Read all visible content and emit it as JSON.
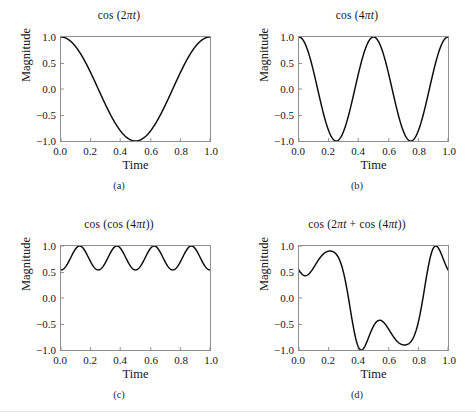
{
  "figure": {
    "background": "#ffffff",
    "curve_color": "#000000",
    "frame_color": "#8e8e8e"
  },
  "axes": {
    "xlabel": "Time",
    "ylabel": "Magnitude",
    "xticks": [
      "0.0",
      "0.2",
      "0.4",
      "0.6",
      "0.8",
      "1.0"
    ],
    "yticks": [
      "1.0",
      "0.5",
      "0.0",
      "−0.5",
      "−1.0"
    ],
    "xlim": [
      0,
      1
    ],
    "ylim": [
      -1,
      1
    ]
  },
  "panels": [
    {
      "key": "a",
      "caption": "(a)",
      "title_pre": "cos (2",
      "title_pi": "π",
      "title_var": "t",
      "title_post": ")",
      "title_plain": "cos (2πt)"
    },
    {
      "key": "b",
      "caption": "(b)",
      "title_pre": "cos (4",
      "title_pi": "π",
      "title_var": "t",
      "title_post": ")",
      "title_plain": "cos (4πt)"
    },
    {
      "key": "c",
      "caption": "(c)",
      "title_pre": "cos (cos (4",
      "title_pi": "π",
      "title_var": "t",
      "title_post": "))",
      "title_plain": "cos (cos (4πt))"
    },
    {
      "key": "d",
      "caption": "(d)",
      "title_pre": "cos (2",
      "title_pi": "π",
      "title_var": "t",
      "title_mid": " + cos (4",
      "title_pi2": "π",
      "title_var2": "t",
      "title_post": "))",
      "title_plain": "cos (2πt + cos (4πt))"
    }
  ],
  "chart_data": [
    {
      "type": "line",
      "panel": "a",
      "title": "cos (2πt)",
      "xlabel": "Time",
      "ylabel": "Magnitude",
      "xlim": [
        0,
        1
      ],
      "ylim": [
        -1,
        1
      ],
      "xticks": [
        0.0,
        0.2,
        0.4,
        0.6,
        0.8,
        1.0
      ],
      "yticks": [
        -1.0,
        -0.5,
        0.0,
        0.5,
        1.0
      ],
      "grid": false,
      "legend": null,
      "formula": "cos(2*pi*t)",
      "x": [
        0.0,
        0.025,
        0.05,
        0.075,
        0.1,
        0.125,
        0.15,
        0.175,
        0.2,
        0.225,
        0.25,
        0.275,
        0.3,
        0.325,
        0.35,
        0.375,
        0.4,
        0.425,
        0.45,
        0.475,
        0.5,
        0.525,
        0.55,
        0.575,
        0.6,
        0.625,
        0.65,
        0.675,
        0.7,
        0.725,
        0.75,
        0.775,
        0.8,
        0.825,
        0.85,
        0.875,
        0.9,
        0.925,
        0.95,
        0.975,
        1.0
      ],
      "y": [
        1.0,
        0.988,
        0.951,
        0.891,
        0.809,
        0.707,
        0.588,
        0.454,
        0.309,
        0.156,
        0.0,
        -0.156,
        -0.309,
        -0.454,
        -0.588,
        -0.707,
        -0.809,
        -0.891,
        -0.951,
        -0.988,
        -1.0,
        -0.988,
        -0.951,
        -0.891,
        -0.809,
        -0.707,
        -0.588,
        -0.454,
        -0.309,
        -0.156,
        0.0,
        0.156,
        0.309,
        0.454,
        0.588,
        0.707,
        0.809,
        0.891,
        0.951,
        0.988,
        1.0
      ]
    },
    {
      "type": "line",
      "panel": "b",
      "title": "cos (4πt)",
      "xlabel": "Time",
      "ylabel": "Magnitude",
      "xlim": [
        0,
        1
      ],
      "ylim": [
        -1,
        1
      ],
      "xticks": [
        0.0,
        0.2,
        0.4,
        0.6,
        0.8,
        1.0
      ],
      "yticks": [
        -1.0,
        -0.5,
        0.0,
        0.5,
        1.0
      ],
      "grid": false,
      "legend": null,
      "formula": "cos(4*pi*t)",
      "x": [
        0.0,
        0.025,
        0.05,
        0.075,
        0.1,
        0.125,
        0.15,
        0.175,
        0.2,
        0.225,
        0.25,
        0.275,
        0.3,
        0.325,
        0.35,
        0.375,
        0.4,
        0.425,
        0.45,
        0.475,
        0.5,
        0.525,
        0.55,
        0.575,
        0.6,
        0.625,
        0.65,
        0.675,
        0.7,
        0.725,
        0.75,
        0.775,
        0.8,
        0.825,
        0.85,
        0.875,
        0.9,
        0.925,
        0.95,
        0.975,
        1.0
      ],
      "y": [
        1.0,
        0.951,
        0.809,
        0.588,
        0.309,
        0.0,
        -0.309,
        -0.588,
        -0.809,
        -0.951,
        -1.0,
        -0.951,
        -0.809,
        -0.588,
        -0.309,
        0.0,
        0.309,
        0.588,
        0.809,
        0.951,
        1.0,
        0.951,
        0.809,
        0.588,
        0.309,
        0.0,
        -0.309,
        -0.588,
        -0.809,
        -0.951,
        -1.0,
        -0.951,
        -0.809,
        -0.588,
        -0.309,
        0.0,
        0.309,
        0.588,
        0.809,
        0.951,
        1.0
      ]
    },
    {
      "type": "line",
      "panel": "c",
      "title": "cos (cos (4πt))",
      "xlabel": "Time",
      "ylabel": "Magnitude",
      "xlim": [
        0,
        1
      ],
      "ylim": [
        -1,
        1
      ],
      "xticks": [
        0.0,
        0.2,
        0.4,
        0.6,
        0.8,
        1.0
      ],
      "yticks": [
        -1.0,
        -0.5,
        0.0,
        0.5,
        1.0
      ],
      "grid": false,
      "legend": null,
      "formula": "cos(cos(4*pi*t))",
      "value_range": [
        0.5403,
        1.0
      ],
      "peaks": 4,
      "x": [
        0.0,
        0.025,
        0.05,
        0.075,
        0.1,
        0.125,
        0.15,
        0.175,
        0.2,
        0.225,
        0.25,
        0.275,
        0.3,
        0.325,
        0.35,
        0.375,
        0.4,
        0.425,
        0.45,
        0.475,
        0.5,
        0.525,
        0.55,
        0.575,
        0.6,
        0.625,
        0.65,
        0.675,
        0.7,
        0.725,
        0.75,
        0.775,
        0.8,
        0.825,
        0.85,
        0.875,
        0.9,
        0.925,
        0.95,
        0.975,
        1.0
      ],
      "y": [
        0.54,
        0.578,
        0.69,
        0.832,
        0.953,
        1.0,
        0.953,
        0.832,
        0.69,
        0.578,
        0.54,
        0.578,
        0.69,
        0.832,
        0.953,
        1.0,
        0.953,
        0.832,
        0.69,
        0.578,
        0.54,
        0.578,
        0.69,
        0.832,
        0.953,
        1.0,
        0.953,
        0.832,
        0.69,
        0.578,
        0.54,
        0.578,
        0.69,
        0.832,
        0.953,
        1.0,
        0.953,
        0.832,
        0.69,
        0.578,
        0.54
      ]
    },
    {
      "type": "line",
      "panel": "d",
      "title": "cos (2πt + cos (4πt))",
      "xlabel": "Time",
      "ylabel": "Magnitude",
      "xlim": [
        0,
        1
      ],
      "ylim": [
        -1,
        1
      ],
      "xticks": [
        0.0,
        0.2,
        0.4,
        0.6,
        0.8,
        1.0
      ],
      "yticks": [
        -1.0,
        -0.5,
        0.0,
        0.5,
        1.0
      ],
      "grid": false,
      "legend": null,
      "formula": "cos(2*pi*t + cos(4*pi*t))",
      "x": [
        0.0,
        0.025,
        0.05,
        0.075,
        0.1,
        0.125,
        0.15,
        0.175,
        0.2,
        0.225,
        0.25,
        0.275,
        0.3,
        0.325,
        0.35,
        0.375,
        0.4,
        0.425,
        0.45,
        0.475,
        0.5,
        0.525,
        0.55,
        0.575,
        0.6,
        0.625,
        0.65,
        0.675,
        0.7,
        0.725,
        0.75,
        0.775,
        0.8,
        0.825,
        0.85,
        0.875,
        0.9,
        0.925,
        0.95,
        0.975,
        1.0
      ],
      "y": [
        0.54,
        0.477,
        0.452,
        0.47,
        0.533,
        0.637,
        0.762,
        0.865,
        0.881,
        0.76,
        0.5,
        0.16,
        -0.189,
        -0.483,
        -0.704,
        -0.854,
        -0.94,
        -0.958,
        -0.891,
        -0.74,
        -0.54,
        -0.369,
        -0.299,
        -0.35,
        -0.5,
        -0.698,
        -0.86,
        -0.929,
        -0.898,
        -0.782,
        -0.54,
        -0.12,
        0.371,
        0.706,
        0.886,
        0.956,
        0.94,
        0.826,
        0.612,
        0.328,
        0.54
      ]
    }
  ]
}
